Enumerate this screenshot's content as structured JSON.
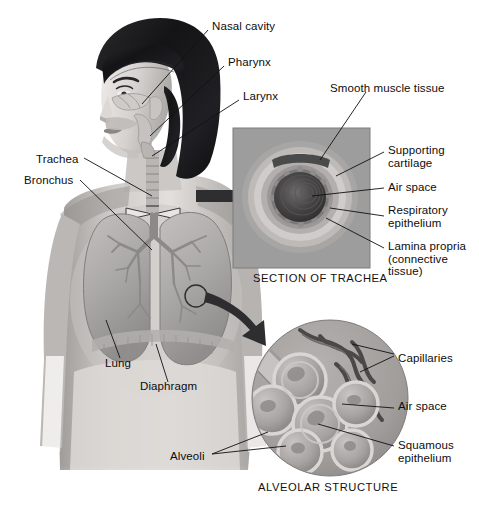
{
  "figure": {
    "body_labels": [
      {
        "key": "nasal_cavity",
        "text": "Nasal cavity",
        "x": 212,
        "y": 26
      },
      {
        "key": "pharynx",
        "text": "Pharynx",
        "x": 228,
        "y": 62
      },
      {
        "key": "larynx",
        "text": "Larynx",
        "x": 243,
        "y": 96
      },
      {
        "key": "trachea",
        "text": "Trachea",
        "x": 36,
        "y": 159
      },
      {
        "key": "bronchus",
        "text": "Bronchus",
        "x": 24,
        "y": 180
      },
      {
        "key": "lung",
        "text": "Lung",
        "x": 105,
        "y": 363
      },
      {
        "key": "diaphragm",
        "text": "Diaphragm",
        "x": 140,
        "y": 386
      }
    ],
    "trachea_inset": {
      "caption": "SECTION OF TRACHEA",
      "caption_x": 253,
      "caption_y": 278,
      "labels": [
        {
          "key": "smooth-muscle-tissue",
          "text": "Smooth muscle tissue",
          "x": 330,
          "y": 88
        },
        {
          "key": "supporting-cartilage",
          "text": "Supporting\ncartilage",
          "x": 388,
          "y": 150
        },
        {
          "key": "air-space",
          "text": "Air space",
          "x": 388,
          "y": 186
        },
        {
          "key": "respiratory-epithelium",
          "text": "Respiratory\nepithelium",
          "x": 388,
          "y": 209
        },
        {
          "key": "lamina-propria",
          "text": "Lamina propria\n(connective\ntissue)",
          "x": 388,
          "y": 246
        }
      ]
    },
    "alveolar_inset": {
      "caption": "ALVEOLAR STRUCTURE",
      "caption_x": 258,
      "caption_y": 487,
      "labels": [
        {
          "key": "capillaries",
          "text": "Capillaries",
          "x": 398,
          "y": 358
        },
        {
          "key": "air-space-alv",
          "text": "Air space",
          "x": 398,
          "y": 406
        },
        {
          "key": "squamous-epithelium",
          "text": "Squamous\nepithelium",
          "x": 398,
          "y": 445
        },
        {
          "key": "alveoli",
          "text": "Alveoli",
          "x": 178,
          "y": 456
        }
      ]
    },
    "colors": {
      "background": "#ffffff",
      "ink": "#0d0d0d",
      "panel_gray": "#9d9d9d",
      "skin_light": "#d7d4d1",
      "skin_mid": "#b4b0ac",
      "hair_dark": "#1b1b1d",
      "organ_gray": "#a9a7a6",
      "lumen_dark": "#3a3a3c",
      "arrow_dark": "#2e2e30"
    }
  }
}
